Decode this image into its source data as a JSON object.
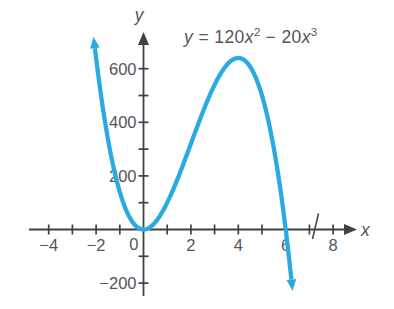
{
  "figure": {
    "equation_label": {
      "lhs": "y",
      "equals": " = ",
      "term1_coeff": "120",
      "term1_var": "x",
      "term1_exp": "2",
      "operator": " − ",
      "term2_coeff": "20",
      "term2_var": "x",
      "term2_exp": "3"
    },
    "x_axis_letter": "x",
    "y_axis_letter": "y",
    "origin_label": "0"
  },
  "chart_data": {
    "type": "line",
    "equation": "y = 120x^2 - 20x^3",
    "coefficients": {
      "x2": 120,
      "x3": -20
    },
    "x_domain_drawn": [
      -2.05,
      6.24
    ],
    "x_range_shown": [
      -4,
      8
    ],
    "y_range_shown": [
      -200,
      700
    ],
    "x_tick_values": [
      -4,
      -3,
      -2,
      -1,
      1,
      2,
      3,
      4,
      5,
      6,
      7,
      8
    ],
    "y_tick_values": [
      -200,
      -100,
      100,
      200,
      300,
      400,
      500,
      600
    ],
    "x_tick_labels": [
      {
        "v": -4,
        "t": "−4"
      },
      {
        "v": -2,
        "t": "−2"
      },
      {
        "v": 2,
        "t": "2"
      },
      {
        "v": 4,
        "t": "4"
      },
      {
        "v": 6,
        "t": "6"
      },
      {
        "v": 8,
        "t": "8"
      }
    ],
    "y_tick_labels": [
      {
        "v": 600,
        "t": "600"
      },
      {
        "v": 400,
        "t": "400"
      },
      {
        "v": 200,
        "t": "200"
      },
      {
        "v": -200,
        "t": "−200"
      }
    ],
    "axis_break_x": 7,
    "key_points": {
      "local_min": {
        "x": 0,
        "y": 0
      },
      "local_max": {
        "x": 4,
        "y": 640
      },
      "x_intercepts": [
        0,
        6
      ]
    },
    "grid": false,
    "legend": false,
    "colors": {
      "curve": "#29ABE2",
      "axis": "#414042",
      "text": "#54555A"
    }
  }
}
